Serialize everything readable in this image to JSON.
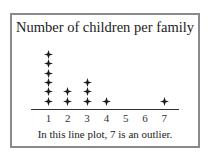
{
  "chart_data": {
    "type": "dot",
    "title": "Number of children per family",
    "categories": [
      "1",
      "2",
      "3",
      "4",
      "5",
      "6",
      "7"
    ],
    "x": [
      1,
      2,
      3,
      4,
      5,
      6,
      7
    ],
    "values": [
      6,
      2,
      3,
      1,
      0,
      0,
      1
    ],
    "marker": "diamond-star",
    "xlabel": "",
    "ylabel": "",
    "grid": false,
    "caption": "In this line plot, 7 is an outlier."
  },
  "colors": {
    "border": "#8a8a8a",
    "marker": "#1a1a1a",
    "text": "#222222"
  }
}
